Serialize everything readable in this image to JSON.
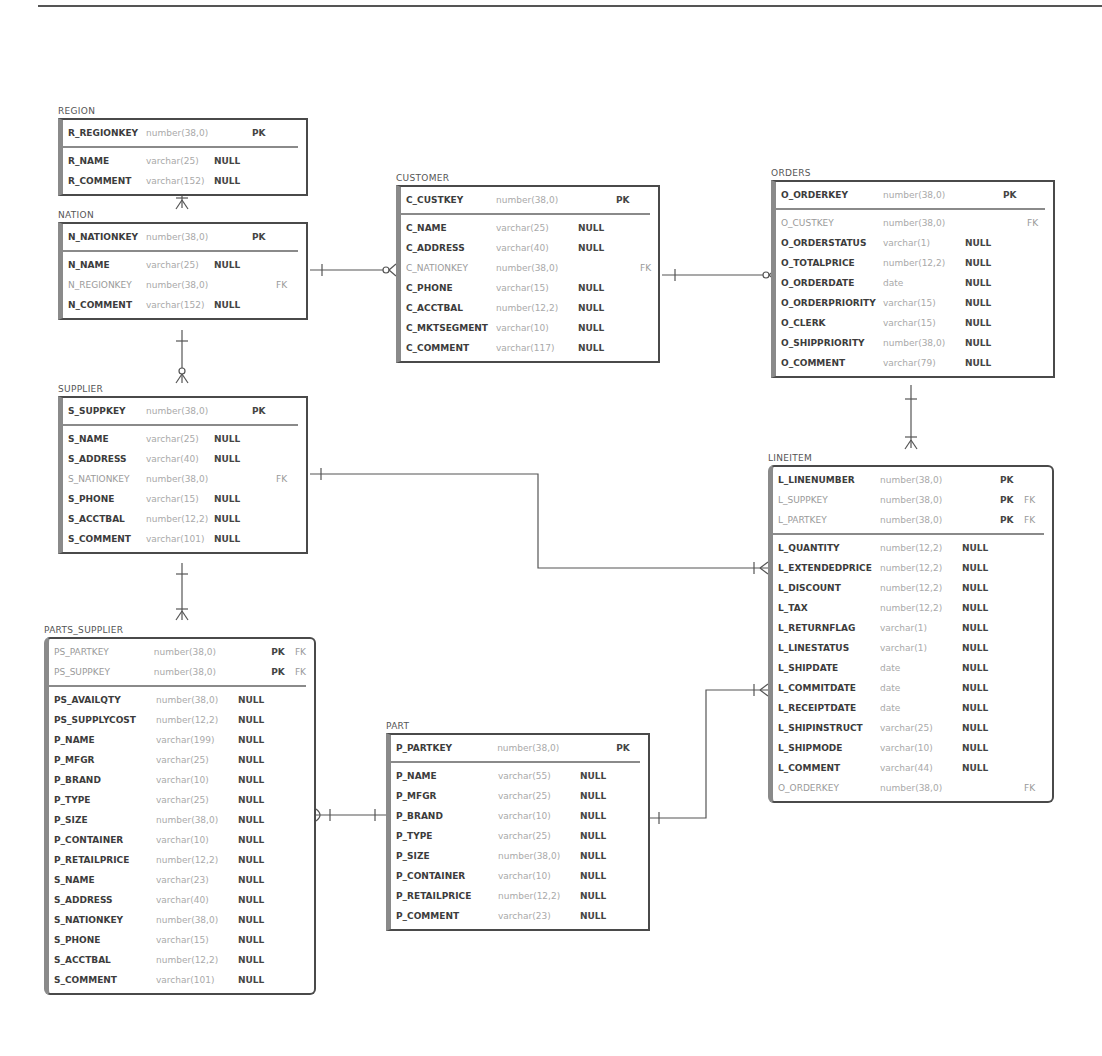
{
  "diagram": {
    "type": "er-diagram",
    "line_color": "#555555",
    "border_color": "#4a4a4a",
    "accent_bar_color": "#8a8a8a"
  },
  "entities": {
    "region": {
      "title": "REGION",
      "keys": [
        {
          "name": "R_REGIONKEY",
          "type": "number(38,0)",
          "null": "",
          "pk": "PK",
          "fk": ""
        }
      ],
      "columns": [
        {
          "name": "R_NAME",
          "type": "varchar(25)",
          "null": "NULL",
          "pk": "",
          "fk": ""
        },
        {
          "name": "R_COMMENT",
          "type": "varchar(152)",
          "null": "NULL",
          "pk": "",
          "fk": ""
        }
      ]
    },
    "nation": {
      "title": "NATION",
      "keys": [
        {
          "name": "N_NATIONKEY",
          "type": "number(38,0)",
          "null": "",
          "pk": "PK",
          "fk": ""
        }
      ],
      "columns": [
        {
          "name": "N_NAME",
          "type": "varchar(25)",
          "null": "NULL",
          "pk": "",
          "fk": ""
        },
        {
          "name": "N_REGIONKEY",
          "type": "number(38,0)",
          "null": "",
          "pk": "",
          "fk": "FK"
        },
        {
          "name": "N_COMMENT",
          "type": "varchar(152)",
          "null": "NULL",
          "pk": "",
          "fk": ""
        }
      ]
    },
    "customer": {
      "title": "CUSTOMER",
      "keys": [
        {
          "name": "C_CUSTKEY",
          "type": "number(38,0)",
          "null": "",
          "pk": "PK",
          "fk": ""
        }
      ],
      "columns": [
        {
          "name": "C_NAME",
          "type": "varchar(25)",
          "null": "NULL",
          "pk": "",
          "fk": ""
        },
        {
          "name": "C_ADDRESS",
          "type": "varchar(40)",
          "null": "NULL",
          "pk": "",
          "fk": ""
        },
        {
          "name": "C_NATIONKEY",
          "type": "number(38,0)",
          "null": "",
          "pk": "",
          "fk": "FK"
        },
        {
          "name": "C_PHONE",
          "type": "varchar(15)",
          "null": "NULL",
          "pk": "",
          "fk": ""
        },
        {
          "name": "C_ACCTBAL",
          "type": "number(12,2)",
          "null": "NULL",
          "pk": "",
          "fk": ""
        },
        {
          "name": "C_MKTSEGMENT",
          "type": "varchar(10)",
          "null": "NULL",
          "pk": "",
          "fk": ""
        },
        {
          "name": "C_COMMENT",
          "type": "varchar(117)",
          "null": "NULL",
          "pk": "",
          "fk": ""
        }
      ]
    },
    "orders": {
      "title": "ORDERS",
      "keys": [
        {
          "name": "O_ORDERKEY",
          "type": "number(38,0)",
          "null": "",
          "pk": "PK",
          "fk": ""
        }
      ],
      "columns": [
        {
          "name": "O_CUSTKEY",
          "type": "number(38,0)",
          "null": "",
          "pk": "",
          "fk": "FK"
        },
        {
          "name": "O_ORDERSTATUS",
          "type": "varchar(1)",
          "null": "NULL",
          "pk": "",
          "fk": ""
        },
        {
          "name": "O_TOTALPRICE",
          "type": "number(12,2)",
          "null": "NULL",
          "pk": "",
          "fk": ""
        },
        {
          "name": "O_ORDERDATE",
          "type": "date",
          "null": "NULL",
          "pk": "",
          "fk": ""
        },
        {
          "name": "O_ORDERPRIORITY",
          "type": "varchar(15)",
          "null": "NULL",
          "pk": "",
          "fk": ""
        },
        {
          "name": "O_CLERK",
          "type": "varchar(15)",
          "null": "NULL",
          "pk": "",
          "fk": ""
        },
        {
          "name": "O_SHIPPRIORITY",
          "type": "number(38,0)",
          "null": "NULL",
          "pk": "",
          "fk": ""
        },
        {
          "name": "O_COMMENT",
          "type": "varchar(79)",
          "null": "NULL",
          "pk": "",
          "fk": ""
        }
      ]
    },
    "supplier": {
      "title": "SUPPLIER",
      "keys": [
        {
          "name": "S_SUPPKEY",
          "type": "number(38,0)",
          "null": "",
          "pk": "PK",
          "fk": ""
        }
      ],
      "columns": [
        {
          "name": "S_NAME",
          "type": "varchar(25)",
          "null": "NULL",
          "pk": "",
          "fk": ""
        },
        {
          "name": "S_ADDRESS",
          "type": "varchar(40)",
          "null": "NULL",
          "pk": "",
          "fk": ""
        },
        {
          "name": "S_NATIONKEY",
          "type": "number(38,0)",
          "null": "",
          "pk": "",
          "fk": "FK"
        },
        {
          "name": "S_PHONE",
          "type": "varchar(15)",
          "null": "NULL",
          "pk": "",
          "fk": ""
        },
        {
          "name": "S_ACCTBAL",
          "type": "number(12,2)",
          "null": "NULL",
          "pk": "",
          "fk": ""
        },
        {
          "name": "S_COMMENT",
          "type": "varchar(101)",
          "null": "NULL",
          "pk": "",
          "fk": ""
        }
      ]
    },
    "lineitem": {
      "title": "LINEITEM",
      "keys": [
        {
          "name": "L_LINENUMBER",
          "type": "number(38,0)",
          "null": "",
          "pk": "PK",
          "fk": ""
        },
        {
          "name": "L_SUPPKEY",
          "type": "number(38,0)",
          "null": "",
          "pk": "PK",
          "fk": "FK"
        },
        {
          "name": "L_PARTKEY",
          "type": "number(38,0)",
          "null": "",
          "pk": "PK",
          "fk": "FK"
        }
      ],
      "columns": [
        {
          "name": "L_QUANTITY",
          "type": "number(12,2)",
          "null": "NULL",
          "pk": "",
          "fk": ""
        },
        {
          "name": "L_EXTENDEDPRICE",
          "type": "number(12,2)",
          "null": "NULL",
          "pk": "",
          "fk": ""
        },
        {
          "name": "L_DISCOUNT",
          "type": "number(12,2)",
          "null": "NULL",
          "pk": "",
          "fk": ""
        },
        {
          "name": "L_TAX",
          "type": "number(12,2)",
          "null": "NULL",
          "pk": "",
          "fk": ""
        },
        {
          "name": "L_RETURNFLAG",
          "type": "varchar(1)",
          "null": "NULL",
          "pk": "",
          "fk": ""
        },
        {
          "name": "L_LINESTATUS",
          "type": "varchar(1)",
          "null": "NULL",
          "pk": "",
          "fk": ""
        },
        {
          "name": "L_SHIPDATE",
          "type": "date",
          "null": "NULL",
          "pk": "",
          "fk": ""
        },
        {
          "name": "L_COMMITDATE",
          "type": "date",
          "null": "NULL",
          "pk": "",
          "fk": ""
        },
        {
          "name": "L_RECEIPTDATE",
          "type": "date",
          "null": "NULL",
          "pk": "",
          "fk": ""
        },
        {
          "name": "L_SHIPINSTRUCT",
          "type": "varchar(25)",
          "null": "NULL",
          "pk": "",
          "fk": ""
        },
        {
          "name": "L_SHIPMODE",
          "type": "varchar(10)",
          "null": "NULL",
          "pk": "",
          "fk": ""
        },
        {
          "name": "L_COMMENT",
          "type": "varchar(44)",
          "null": "NULL",
          "pk": "",
          "fk": ""
        },
        {
          "name": "O_ORDERKEY",
          "type": "number(38,0)",
          "null": "",
          "pk": "",
          "fk": "FK"
        }
      ]
    },
    "parts_supplier": {
      "title": "PARTS_SUPPLIER",
      "keys": [
        {
          "name": "PS_PARTKEY",
          "type": "number(38,0)",
          "null": "",
          "pk": "PK",
          "fk": "FK"
        },
        {
          "name": "PS_SUPPKEY",
          "type": "number(38,0)",
          "null": "",
          "pk": "PK",
          "fk": "FK"
        }
      ],
      "columns": [
        {
          "name": "PS_AVAILQTY",
          "type": "number(38,0)",
          "null": "NULL",
          "pk": "",
          "fk": ""
        },
        {
          "name": "PS_SUPPLYCOST",
          "type": "number(12,2)",
          "null": "NULL",
          "pk": "",
          "fk": ""
        },
        {
          "name": "P_NAME",
          "type": "varchar(199)",
          "null": "NULL",
          "pk": "",
          "fk": ""
        },
        {
          "name": "P_MFGR",
          "type": "varchar(25)",
          "null": "NULL",
          "pk": "",
          "fk": ""
        },
        {
          "name": "P_BRAND",
          "type": "varchar(10)",
          "null": "NULL",
          "pk": "",
          "fk": ""
        },
        {
          "name": "P_TYPE",
          "type": "varchar(25)",
          "null": "NULL",
          "pk": "",
          "fk": ""
        },
        {
          "name": "P_SIZE",
          "type": "number(38,0)",
          "null": "NULL",
          "pk": "",
          "fk": ""
        },
        {
          "name": "P_CONTAINER",
          "type": "varchar(10)",
          "null": "NULL",
          "pk": "",
          "fk": ""
        },
        {
          "name": "P_RETAILPRICE",
          "type": "number(12,2)",
          "null": "NULL",
          "pk": "",
          "fk": ""
        },
        {
          "name": "S_NAME",
          "type": "varchar(23)",
          "null": "NULL",
          "pk": "",
          "fk": ""
        },
        {
          "name": "S_ADDRESS",
          "type": "varchar(40)",
          "null": "NULL",
          "pk": "",
          "fk": ""
        },
        {
          "name": "S_NATIONKEY",
          "type": "number(38,0)",
          "null": "NULL",
          "pk": "",
          "fk": ""
        },
        {
          "name": "S_PHONE",
          "type": "varchar(15)",
          "null": "NULL",
          "pk": "",
          "fk": ""
        },
        {
          "name": "S_ACCTBAL",
          "type": "number(12,2)",
          "null": "NULL",
          "pk": "",
          "fk": ""
        },
        {
          "name": "S_COMMENT",
          "type": "varchar(101)",
          "null": "NULL",
          "pk": "",
          "fk": ""
        }
      ]
    },
    "part": {
      "title": "PART",
      "keys": [
        {
          "name": "P_PARTKEY",
          "type": "number(38,0)",
          "null": "",
          "pk": "PK",
          "fk": ""
        }
      ],
      "columns": [
        {
          "name": "P_NAME",
          "type": "varchar(55)",
          "null": "NULL",
          "pk": "",
          "fk": ""
        },
        {
          "name": "P_MFGR",
          "type": "varchar(25)",
          "null": "NULL",
          "pk": "",
          "fk": ""
        },
        {
          "name": "P_BRAND",
          "type": "varchar(10)",
          "null": "NULL",
          "pk": "",
          "fk": ""
        },
        {
          "name": "P_TYPE",
          "type": "varchar(25)",
          "null": "NULL",
          "pk": "",
          "fk": ""
        },
        {
          "name": "P_SIZE",
          "type": "number(38,0)",
          "null": "NULL",
          "pk": "",
          "fk": ""
        },
        {
          "name": "P_CONTAINER",
          "type": "varchar(10)",
          "null": "NULL",
          "pk": "",
          "fk": ""
        },
        {
          "name": "P_RETAILPRICE",
          "type": "number(12,2)",
          "null": "NULL",
          "pk": "",
          "fk": ""
        },
        {
          "name": "P_COMMENT",
          "type": "varchar(23)",
          "null": "NULL",
          "pk": "",
          "fk": ""
        }
      ]
    }
  },
  "relationships": [
    {
      "from": "REGION",
      "to": "NATION",
      "from_card": "one",
      "to_card": "one-or-many"
    },
    {
      "from": "NATION",
      "to": "CUSTOMER",
      "from_card": "one",
      "to_card": "zero-or-many"
    },
    {
      "from": "NATION",
      "to": "SUPPLIER",
      "from_card": "one",
      "to_card": "zero-or-many"
    },
    {
      "from": "CUSTOMER",
      "to": "ORDERS",
      "from_card": "one",
      "to_card": "zero-or-many"
    },
    {
      "from": "ORDERS",
      "to": "LINEITEM",
      "from_card": "one",
      "to_card": "one-or-many"
    },
    {
      "from": "SUPPLIER",
      "to": "LINEITEM",
      "from_card": "one",
      "to_card": "one-or-many"
    },
    {
      "from": "SUPPLIER",
      "to": "PARTS_SUPPLIER",
      "from_card": "one",
      "to_card": "one-or-many"
    },
    {
      "from": "PART",
      "to": "PARTS_SUPPLIER",
      "from_card": "one",
      "to_card": "zero-or-one"
    },
    {
      "from": "PART",
      "to": "LINEITEM",
      "from_card": "one",
      "to_card": "one-or-many"
    }
  ]
}
